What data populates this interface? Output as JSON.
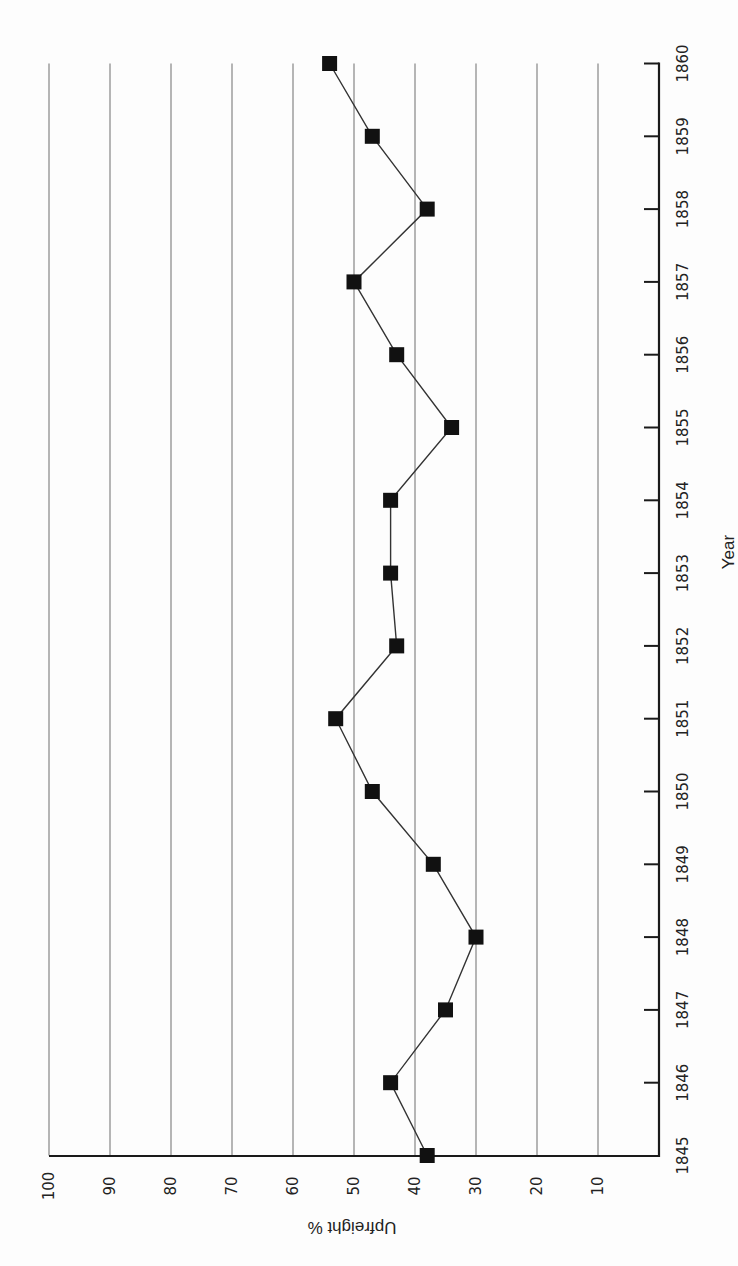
{
  "chart_data": {
    "type": "line",
    "orientation": "rotated-90-ccw",
    "title": "",
    "xlabel": "Year",
    "ylabel": "Upfreight %",
    "categories": [
      "1845",
      "1846",
      "1847",
      "1848",
      "1849",
      "1850",
      "1851",
      "1852",
      "1853",
      "1854",
      "1855",
      "1856",
      "1857",
      "1858",
      "1859",
      "1860"
    ],
    "series": [
      {
        "name": "Upfreight %",
        "marker": "square",
        "values": [
          38,
          44,
          35,
          30,
          37,
          47,
          53,
          43,
          44,
          44,
          34,
          43,
          50,
          38,
          47,
          54
        ]
      }
    ],
    "ylim": [
      0,
      100
    ],
    "yticks": [
      10,
      20,
      30,
      40,
      50,
      60,
      70,
      80,
      90,
      100
    ],
    "grid": true,
    "legend": "none"
  },
  "colors": {
    "grid": "#7a7a7a",
    "axis": "#1a1a1a",
    "line": "#333333",
    "marker": "#111111"
  }
}
